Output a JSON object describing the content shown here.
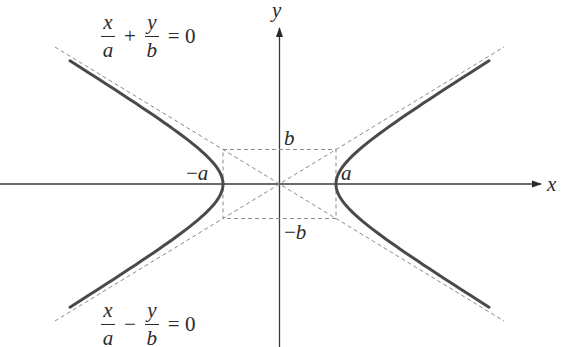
{
  "diagram": {
    "center": [
      279.5,
      184
    ],
    "a_px": 56.5,
    "b_px": 34.5,
    "colors": {
      "curve": "#4a4a4a",
      "axis": "#3a3a3a",
      "dashed": "#8a8a8a",
      "text": "#2a2a2a",
      "background": "#ffffff"
    },
    "axes": {
      "x_label": "x",
      "y_label": "y"
    },
    "vertex_labels": {
      "neg_a": {
        "sign": "−",
        "var": "a"
      },
      "pos_a": "a",
      "pos_b": "b",
      "neg_b": {
        "sign": "−",
        "var": "b"
      }
    },
    "asymptote_equations": {
      "upper": {
        "num1": "x",
        "den1": "a",
        "op": "+",
        "num2": "y",
        "den2": "b",
        "rhs": "= 0"
      },
      "lower": {
        "num1": "x",
        "den1": "a",
        "op": "−",
        "num2": "y",
        "den2": "b",
        "rhs": "= 0"
      }
    }
  }
}
